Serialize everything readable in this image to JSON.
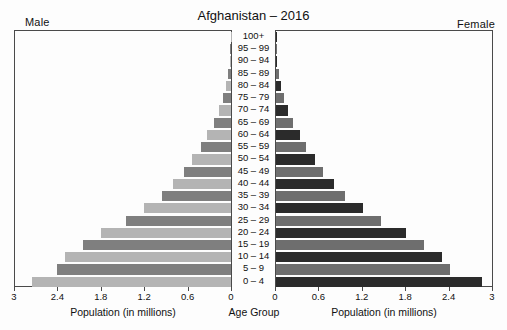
{
  "chart_data": {
    "type": "bar",
    "subtype": "population-pyramid",
    "title": "Afghanistan – 2016",
    "left_label": "Male",
    "right_label": "Female",
    "xlabel_left": "Population (in millions)",
    "xlabel_right": "Population (in millions)",
    "xlabel_center": "Age Group",
    "ylabel": "Age Group",
    "grid": false,
    "legend": "none",
    "xlim_left": [
      3,
      0
    ],
    "xlim_right": [
      0,
      3
    ],
    "xticks_left": [
      "3",
      "2.4",
      "1.8",
      "1.2",
      "0.6",
      "0"
    ],
    "xticks_right": [
      "0",
      "0.6",
      "1.2",
      "1.8",
      "2.4",
      "3"
    ],
    "xtick_values": [
      3,
      2.4,
      1.8,
      1.2,
      0.6,
      0
    ],
    "categories": [
      "100+",
      "95 – 99",
      "90 – 94",
      "85 – 89",
      "80 – 84",
      "75 – 79",
      "70 – 74",
      "65 – 69",
      "60 – 64",
      "55 – 59",
      "50 – 54",
      "45 – 49",
      "40 – 44",
      "35 – 39",
      "30 – 34",
      "25 – 29",
      "20 – 24",
      "15 – 19",
      "10 – 14",
      "5 – 9",
      "0 – 4"
    ],
    "series": [
      {
        "name": "Male",
        "side": "left",
        "values": [
          0.005,
          0.012,
          0.02,
          0.035,
          0.07,
          0.11,
          0.17,
          0.24,
          0.33,
          0.42,
          0.54,
          0.65,
          0.8,
          0.95,
          1.2,
          1.45,
          1.8,
          2.05,
          2.3,
          2.4,
          2.75
        ]
      },
      {
        "name": "Female",
        "side": "right",
        "values": [
          0.005,
          0.012,
          0.02,
          0.035,
          0.07,
          0.11,
          0.17,
          0.24,
          0.33,
          0.42,
          0.54,
          0.65,
          0.8,
          0.95,
          1.2,
          1.45,
          1.8,
          2.05,
          2.3,
          2.4,
          2.85
        ]
      }
    ],
    "colors": {
      "male_light": "#b4b4b4",
      "male_dark": "#7f7f7f",
      "female_dark": "#2b2b2b",
      "female_mid": "#6e6e6e",
      "axis": "#4a4a4a",
      "background": "#fdfdfd",
      "text": "#111111"
    }
  }
}
